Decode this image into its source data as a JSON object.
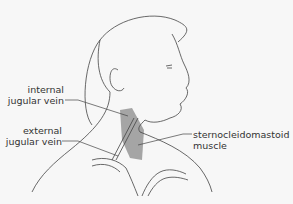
{
  "diagram": {
    "title": "",
    "labels": {
      "internal_jugular_vein": [
        "internal",
        "jugular vein"
      ],
      "external_jugular_vein": [
        "external",
        "jugular vein"
      ],
      "sternocleidomastoid_muscle": [
        "sternocleidomastoid",
        "muscle"
      ]
    },
    "colors": {
      "background": "#f7f7f7",
      "outline": "#444444",
      "muscle_shade": "#8a8a8a",
      "text": "#333333"
    }
  }
}
